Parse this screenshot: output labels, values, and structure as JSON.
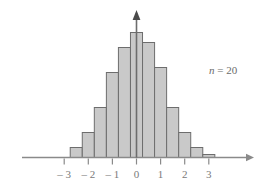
{
  "chart_data": {
    "type": "bar",
    "title": "",
    "subtitle": "",
    "xlabel": "",
    "ylabel": "",
    "grid": false,
    "legend": null,
    "xlim": [
      -3.6,
      3.6
    ],
    "ylim": [
      0,
      14
    ],
    "xticks": [
      -3,
      -2,
      -1,
      0,
      1,
      2,
      3
    ],
    "xtick_labels": [
      "– 3",
      "– 2",
      "– 1",
      "0",
      "1",
      "2",
      "3"
    ],
    "yticks": [],
    "ytick_labels": [],
    "bin_width": 0.5,
    "bin_left_edges": [
      -2.75,
      -2.25,
      -1.75,
      -1.25,
      -0.75,
      -0.25,
      0.25,
      0.75,
      1.25,
      1.75,
      2.25,
      2.75
    ],
    "categories": [
      "-2.5",
      "-2.0",
      "-1.5",
      "-1.0",
      "-0.5",
      "0.0",
      "0.5",
      "1.0",
      "1.5",
      "2.0",
      "2.5",
      "3.0"
    ],
    "values": [
      1,
      2.5,
      5,
      8.5,
      11,
      12.5,
      11.5,
      9,
      5,
      2.5,
      1,
      0.3
    ],
    "annotations": [
      {
        "text_italic": "n",
        "text_rest": " = 20",
        "x_px": 198,
        "y_px": 52
      }
    ],
    "axis_arrows": {
      "x_axis_right_arrow": true,
      "y_axis_up_arrow": true
    },
    "colors": {
      "bar_fill": "#c9c9c9",
      "bar_stroke": "#6d6d6d",
      "axis": "#8a8a8a",
      "text": "#7a7a7a",
      "background": "#ffffff"
    }
  }
}
